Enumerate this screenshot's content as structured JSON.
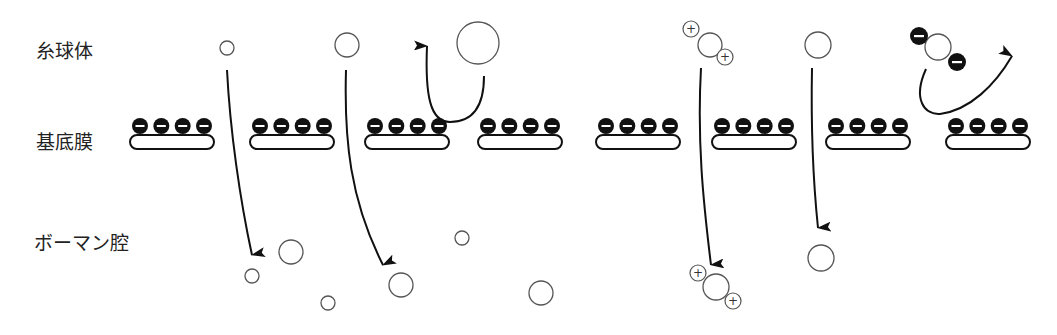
{
  "labels": {
    "glomerulus": "糸球体",
    "basement_membrane": "基底膜",
    "bowman_space": "ボーマン腔"
  },
  "colors": {
    "line": "#111111",
    "circle_stroke": "#555555",
    "charge_fill": "#111111",
    "background": "#ffffff"
  },
  "membrane": {
    "segments_x": [
      130,
      250,
      365,
      478,
      596,
      712,
      826,
      946
    ],
    "segment_width": 84,
    "charges_per_segment": 4,
    "charge_sign": "−"
  },
  "molecules": {
    "plus_sign": "+",
    "minus_sign": "−"
  }
}
